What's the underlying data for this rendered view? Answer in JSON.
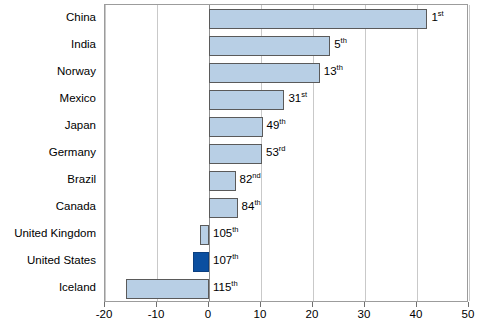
{
  "chart_data": {
    "type": "bar",
    "orientation": "horizontal",
    "title": "",
    "subtitle": "",
    "xlabel": "",
    "ylabel": "",
    "xlim": [
      -20,
      50
    ],
    "ylim": null,
    "grid": true,
    "gridlines_axis": "x",
    "legend": false,
    "legend_position": "none",
    "xticks": [
      -20,
      -10,
      0,
      10,
      20,
      30,
      40,
      50
    ],
    "xtick_labels": [
      "-20",
      "-10",
      "0",
      "10",
      "20",
      "30",
      "40",
      "50"
    ],
    "categories": [
      "China",
      "India",
      "Norway",
      "Mexico",
      "Japan",
      "Germany",
      "Brazil",
      "Canada",
      "United Kingdom",
      "United States",
      "Iceland"
    ],
    "values": [
      42.0,
      23.3,
      21.3,
      14.5,
      10.3,
      10.2,
      5.1,
      5.5,
      -1.8,
      -3.1,
      -16.0
    ],
    "annotations": [
      {
        "text": "1",
        "suffix": "st",
        "display": "1st"
      },
      {
        "text": "5",
        "suffix": "th",
        "display": "5th"
      },
      {
        "text": "13",
        "suffix": "th",
        "display": "13th"
      },
      {
        "text": "31",
        "suffix": "st",
        "display": "31st"
      },
      {
        "text": "49",
        "suffix": "th",
        "display": "49th"
      },
      {
        "text": "53",
        "suffix": "rd",
        "display": "53rd"
      },
      {
        "text": "82",
        "suffix": "nd",
        "display": "82nd"
      },
      {
        "text": "84",
        "suffix": "th",
        "display": "84th"
      },
      {
        "text": "105",
        "suffix": "th",
        "display": "105th"
      },
      {
        "text": "107",
        "suffix": "th",
        "display": "107th"
      },
      {
        "text": "115",
        "suffix": "th",
        "display": "115th"
      }
    ],
    "highlight_category": "United States",
    "colors": {
      "bar_fill": "#b8cfe5",
      "bar_border": "#5a5a5a",
      "highlight_fill": "#0b4fa0",
      "highlight_border": "#0b3f80",
      "gridline": "#c9c9c9",
      "axis_border": "#9c9c9c",
      "text": "#000000",
      "background": "#ffffff"
    }
  }
}
